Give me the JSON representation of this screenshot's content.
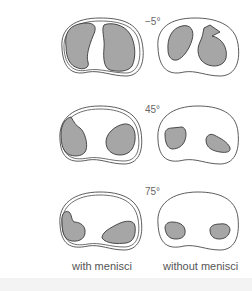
{
  "figure": {
    "rows": [
      {
        "angle": "−5°"
      },
      {
        "angle": "45°"
      },
      {
        "angle": "75°"
      }
    ],
    "columns": [
      {
        "label": "with menisci"
      },
      {
        "label": "without menisci"
      }
    ],
    "colors": {
      "contact_fill": "#a6a6a6",
      "outline_stroke": "#4a4a4a",
      "background": "#ffffff"
    }
  }
}
